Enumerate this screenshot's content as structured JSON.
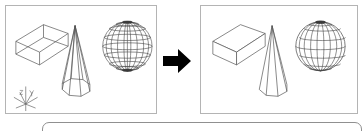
{
  "figure": {
    "type": "cad-illustration",
    "before_label": "Wireframe display",
    "after_label": "Hidden lines removed",
    "arrow_label": "transforms to"
  },
  "colors": {
    "background": "#ffffff",
    "panel_border": "#b4b4b4",
    "model_line": "#555555",
    "model_line_dark": "#333333",
    "arrow_fill": "#000000",
    "bottom_panel_border": "#909090"
  },
  "panels": [
    {
      "id": "before",
      "name": "wireframe-viewport",
      "mode": "Wireframe",
      "objects": [
        {
          "name": "box",
          "shape": "rectangular-box",
          "hidden_lines": "visible"
        },
        {
          "name": "cone",
          "shape": "polygonal-cone",
          "hidden_lines": "visible"
        },
        {
          "name": "sphere",
          "shape": "lat-long-sphere",
          "hidden_lines": "visible"
        }
      ],
      "ucs_icon": {
        "name": "ucs-axis-icon",
        "visible": true
      }
    },
    {
      "id": "after",
      "name": "hidden-line-viewport",
      "mode": "Hidden",
      "objects": [
        {
          "name": "box",
          "shape": "rectangular-box",
          "hidden_lines": "removed"
        },
        {
          "name": "cone",
          "shape": "polygonal-cone",
          "hidden_lines": "removed"
        },
        {
          "name": "sphere",
          "shape": "lat-long-sphere",
          "hidden_lines": "removed"
        }
      ],
      "ucs_icon": {
        "name": "ucs-axis-icon",
        "visible": false
      }
    }
  ],
  "arrow": {
    "name": "transform-arrow",
    "direction": "right",
    "fill": "#000000"
  },
  "bottom_panel": {
    "name": "rounded-panel",
    "visible_portion": "top-edge-only",
    "corner_radius": 7
  }
}
